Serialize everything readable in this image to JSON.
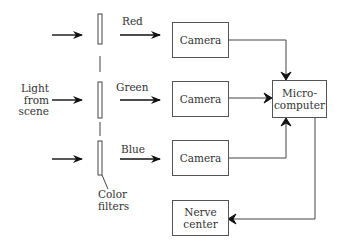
{
  "diagram": {
    "input_label": [
      "Light",
      "from",
      "scene"
    ],
    "filters_label": [
      "Color",
      "filters"
    ],
    "channels": [
      {
        "label": "Red",
        "camera": "Camera"
      },
      {
        "label": "Green",
        "camera": "Camera"
      },
      {
        "label": "Blue",
        "camera": "Camera"
      }
    ],
    "processor": [
      "Micro-",
      "computer"
    ],
    "output": [
      "Nerve",
      "center"
    ]
  }
}
